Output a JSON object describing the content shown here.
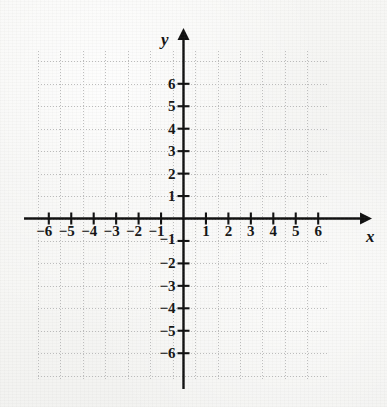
{
  "figure": {
    "kind": "cartesian-coordinate-plane",
    "axis_labels": {
      "x": "x",
      "y": "y"
    },
    "origin_label": ""
  },
  "chart_data": {
    "type": "scatter",
    "title": "",
    "subtitle": "",
    "xlabel": "x",
    "ylabel": "y",
    "xlim": [
      -6,
      6
    ],
    "ylim": [
      -6,
      6
    ],
    "grid": true,
    "grid_style": "dotted",
    "grid_spacing": 1,
    "legend": "none",
    "series": [],
    "x": [],
    "y": [],
    "annotations": [],
    "x_tick_labels": [
      "−6",
      "−5",
      "−4",
      "−3",
      "−2",
      "−1",
      "1",
      "2",
      "3",
      "4",
      "5",
      "6"
    ],
    "y_tick_labels": [
      "6",
      "5",
      "4",
      "3",
      "2",
      "1",
      "−1",
      "−2",
      "−3",
      "−4",
      "−5",
      "−6"
    ],
    "x_tick_values": [
      -6,
      -5,
      -4,
      -3,
      -2,
      -1,
      1,
      2,
      3,
      4,
      5,
      6
    ],
    "y_tick_values": [
      6,
      5,
      4,
      3,
      2,
      1,
      -1,
      -2,
      -3,
      -4,
      -5,
      -6
    ],
    "colors": {
      "axis": "#101010",
      "grid": "#bdbdbd",
      "label": "#141414",
      "background": "#f5f5f3"
    }
  }
}
